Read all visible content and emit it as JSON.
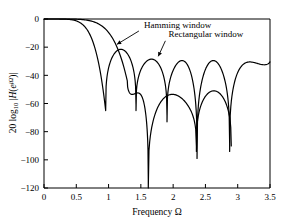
{
  "chart_data": {
    "type": "line",
    "title": "",
    "xlabel": "Frequency Ω",
    "ylabel": "20 log10 | H(e^jΩ) |",
    "ylabel_parts": {
      "lead": "20 log",
      "subscript": "10",
      "bar_open": "|",
      "H": "H",
      "paren_open": "(",
      "e": "e",
      "exponent": "jΩ",
      "paren_close": ")",
      "bar_close": "|"
    },
    "xlim": [
      0,
      3.5
    ],
    "ylim": [
      -120,
      0
    ],
    "xticks": [
      0,
      0.5,
      1,
      1.5,
      2,
      2.5,
      3,
      3.5
    ],
    "xtick_labels": [
      "0",
      "0.5",
      "1",
      "1.5",
      "2",
      "2.5",
      "3",
      "3.5"
    ],
    "yticks": [
      0,
      -20,
      -40,
      -60,
      -80,
      -100,
      -120
    ],
    "ytick_labels": [
      "0",
      "−20",
      "−40",
      "−60",
      "−80",
      "−100",
      "−120"
    ],
    "grid": false,
    "legend_position": "inline-annotations",
    "line_color": "#000000",
    "line_width": 1.2,
    "annotations": [
      {
        "label": "Hamming window",
        "text_x": 1.55,
        "text_y": -6.5,
        "arrow_from_x": 1.47,
        "arrow_from_y": -8.5,
        "arrow_to_x": 1.13,
        "arrow_to_y": -18.0
      },
      {
        "label": "Rectangular window",
        "text_x": 1.93,
        "text_y": -13.0,
        "arrow_from_x": 1.88,
        "arrow_from_y": -15.5,
        "arrow_to_x": 1.77,
        "arrow_to_y": -26.5
      }
    ],
    "series": [
      {
        "name": "Rectangular window",
        "nulls": [
          0.955,
          1.425,
          1.905,
          2.37,
          2.875
        ],
        "null_depths_db": [
          -65,
          -65,
          -73,
          -99,
          -94
        ],
        "sidelobe_peaks": [
          {
            "x": 1.19,
            "y": -21.5
          },
          {
            "x": 1.67,
            "y": -28.5
          },
          {
            "x": 2.14,
            "y": -29.5
          },
          {
            "x": 2.63,
            "y": -29.5
          },
          {
            "x": 3.14,
            "y": -30.5
          }
        ],
        "mainlobe_start_db": 0.0
      },
      {
        "name": "Hamming window",
        "nulls": [
          1.29,
          1.615,
          2.36,
          2.9
        ],
        "null_depths_db": [
          -44,
          -120,
          -94,
          -94
        ],
        "sidelobe_peaks": [
          {
            "x": 1.95,
            "y": -52.5
          },
          {
            "x": 2.63,
            "y": -53.5
          },
          {
            "x": 3.14,
            "y": -51.0
          }
        ],
        "mainlobe_start_db": 0.0
      }
    ]
  }
}
